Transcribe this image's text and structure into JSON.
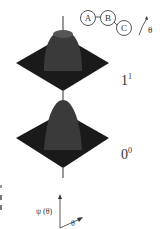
{
  "molecule": {
    "atoms": [
      "A",
      "B",
      "C"
    ],
    "angle_label": "θ"
  },
  "surfaces": [
    {
      "state_label": "1",
      "state_superscript": "1"
    },
    {
      "state_label": "0",
      "state_superscript": "0"
    }
  ],
  "axes": {
    "y_label": "ψ (θ)",
    "x_label": "θ"
  },
  "colors": {
    "mesh": "#1a1a1a",
    "mesh_light": "#e8e8e8",
    "line": "#333333"
  }
}
